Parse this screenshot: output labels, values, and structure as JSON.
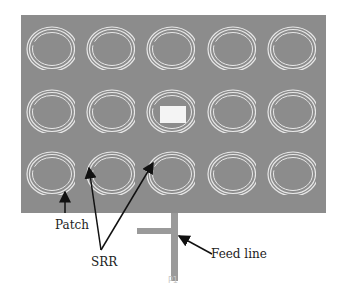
{
  "diagram": {
    "type": "antenna-layout",
    "grid": {
      "rows": 3,
      "cols": 5
    },
    "colors": {
      "substrate": "#8c8c8c",
      "ring": "#e8e8e8",
      "patch": "#f4f4f4",
      "feed": "#9a9a9a",
      "arrow": "#111111"
    }
  },
  "labels": {
    "patch": "Patch",
    "srr": "SRR",
    "feed_line": "Feed line",
    "port": "P1"
  }
}
